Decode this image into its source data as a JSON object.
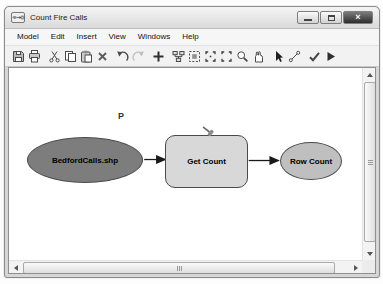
{
  "window": {
    "title": "Count Fire Calls",
    "controls": {
      "close_glyph": "×"
    }
  },
  "menu": {
    "items": [
      "Model",
      "Edit",
      "Insert",
      "View",
      "Windows",
      "Help"
    ]
  },
  "toolbar": {
    "items": [
      "save",
      "print",
      "cut",
      "copy",
      "paste",
      "delete",
      "undo",
      "redo",
      "add-data",
      "auto-layout",
      "full-extent",
      "fixed-zoom-in",
      "fixed-zoom-out",
      "zoom",
      "pan",
      "select",
      "add-connection",
      "validate",
      "run"
    ]
  },
  "diagram": {
    "parameter_label": "P",
    "nodes": [
      {
        "id": "input-data",
        "label": "BedfordCalls.shp",
        "shape": "ellipse",
        "fill": "#7d7d7d",
        "border": "#4a4a4a"
      },
      {
        "id": "tool",
        "label": "Get Count",
        "shape": "rounded-rectangle",
        "fill": "#d8d8d8",
        "border": "#4a4a4a"
      },
      {
        "id": "derived-data",
        "label": "Row Count",
        "shape": "ellipse",
        "fill": "#bfbfbf",
        "border": "#4a4a4a"
      }
    ],
    "connections": [
      {
        "from": "BedfordCalls.shp",
        "to": "Get Count"
      },
      {
        "from": "Get Count",
        "to": "Row Count"
      }
    ]
  },
  "colors": {
    "arrow": "#1a1a1a",
    "canvas_bg": "#ffffff",
    "frame": "#d6d6d6"
  }
}
